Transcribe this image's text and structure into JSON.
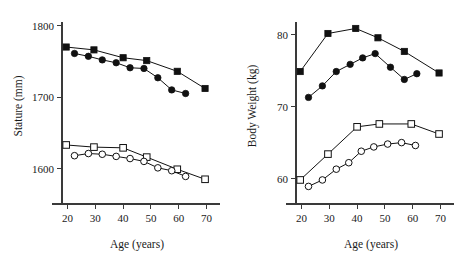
{
  "figure": {
    "background": "#ffffff",
    "line_color": "#111111",
    "axis_color": "#3a3a3a"
  },
  "chart_data": [
    {
      "type": "line",
      "panel": "left",
      "title": "",
      "xlabel": "Age (years)",
      "ylabel": "Stature (mm)",
      "xlim": [
        18,
        72
      ],
      "ylim": [
        1570,
        1805
      ],
      "xticks": [
        20,
        30,
        40,
        50,
        60,
        70
      ],
      "yticks": [
        1600,
        1700,
        1800
      ],
      "xticklabels": [
        "20",
        "30",
        "40",
        "50",
        "60",
        "70"
      ],
      "yticklabels": [
        "1600",
        "1700",
        "1800"
      ],
      "grid": false,
      "legend": "none",
      "series": [
        {
          "name": "filled-square",
          "marker": "filled-square",
          "x": [
            19.5,
            29.5,
            40.0,
            48.5,
            59.5,
            69.5
          ],
          "values": [
            1770,
            1766,
            1755,
            1751,
            1736,
            1712
          ]
        },
        {
          "name": "filled-circle",
          "marker": "filled-circle",
          "x": [
            22.5,
            27.5,
            32.5,
            37.5,
            42.5,
            47.5,
            52.5,
            57.5,
            62.5
          ],
          "values": [
            1761,
            1757,
            1752,
            1748,
            1741,
            1740,
            1727,
            1710,
            1705
          ]
        },
        {
          "name": "open-square",
          "marker": "open-square",
          "x": [
            19.5,
            29.5,
            40.0,
            48.5,
            59.5,
            69.5
          ],
          "values": [
            1633,
            1630,
            1629,
            1616,
            1599,
            1585
          ]
        },
        {
          "name": "open-circle",
          "marker": "open-circle",
          "x": [
            22.5,
            27.5,
            32.5,
            37.5,
            42.5,
            47.5,
            52.5,
            57.5,
            62.5
          ],
          "values": [
            1618,
            1621,
            1620,
            1617,
            1614,
            1610,
            1601,
            1597,
            1589
          ]
        }
      ]
    },
    {
      "type": "line",
      "panel": "right",
      "title": "",
      "xlabel": "Age (years)",
      "ylabel": "Body Weight (kg)",
      "xlim": [
        18,
        72
      ],
      "ylim": [
        58.4,
        81.8
      ],
      "xticks": [
        20,
        30,
        40,
        50,
        60,
        70
      ],
      "yticks": [
        60,
        70,
        80
      ],
      "xticklabels": [
        "20",
        "30",
        "40",
        "50",
        "60",
        "70"
      ],
      "yticklabels": [
        "60",
        "70",
        "80"
      ],
      "grid": false,
      "legend": "none",
      "series": [
        {
          "name": "filled-square",
          "marker": "filled-square",
          "x": [
            19.5,
            29.5,
            39.5,
            47.5,
            57.0,
            69.5
          ],
          "values": [
            74.9,
            80.2,
            80.9,
            79.6,
            77.7,
            74.7
          ]
        },
        {
          "name": "filled-circle",
          "marker": "filled-circle",
          "x": [
            22.5,
            27.5,
            32.5,
            37.5,
            42.0,
            46.5,
            52.0,
            57.0,
            61.5
          ],
          "values": [
            71.3,
            72.9,
            74.9,
            75.9,
            76.8,
            77.4,
            75.5,
            73.8,
            74.6
          ]
        },
        {
          "name": "open-square",
          "marker": "open-square",
          "x": [
            19.5,
            29.5,
            40.0,
            48.0,
            59.5,
            69.5
          ],
          "values": [
            59.8,
            63.4,
            67.2,
            67.6,
            67.6,
            66.2
          ]
        },
        {
          "name": "open-circle",
          "marker": "open-circle",
          "x": [
            22.5,
            27.5,
            32.5,
            37.0,
            41.5,
            46.0,
            51.0,
            56.0,
            61.0
          ],
          "values": [
            58.9,
            59.8,
            61.3,
            62.2,
            63.8,
            64.4,
            64.8,
            65.0,
            64.6
          ]
        }
      ]
    }
  ]
}
